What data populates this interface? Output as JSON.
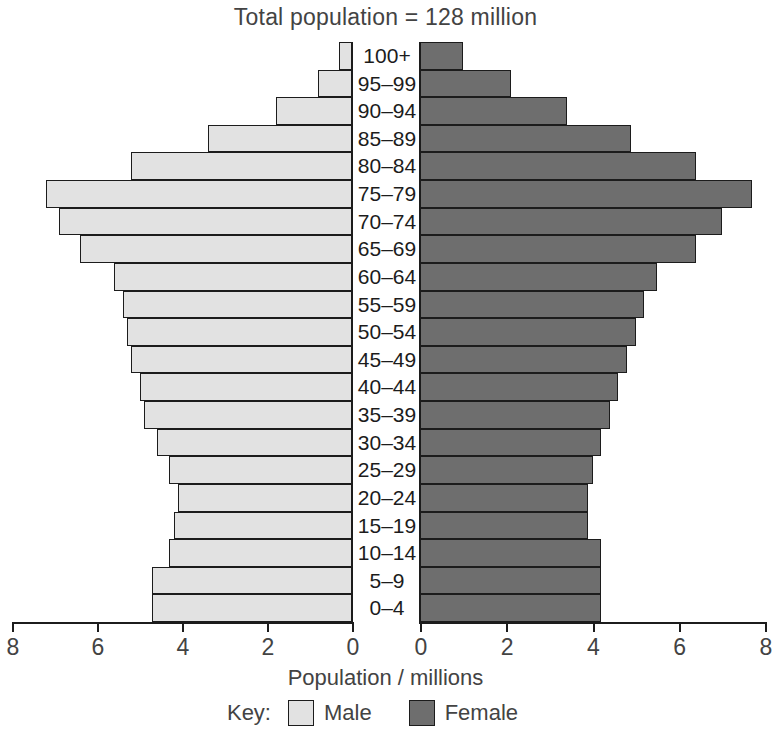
{
  "chart": {
    "title": "Total population = 128 million",
    "axis_caption": "Population / millions",
    "legend": {
      "key_label": "Key:",
      "entries": [
        {
          "label": "Male",
          "color": "#e2e2e2"
        },
        {
          "label": "Female",
          "color": "#6e6e6e"
        }
      ]
    },
    "tick_labels_male": [
      "8",
      "6",
      "4",
      "2",
      "0"
    ],
    "tick_labels_female": [
      "0",
      "2",
      "4",
      "6",
      "8"
    ]
  },
  "chart_data": {
    "type": "bar",
    "subtype": "population-pyramid",
    "title": "Total population = 128 million",
    "xlabel": "Population / millions",
    "ylabel": "Age group / years",
    "total_population_millions": 128,
    "xlim": [
      0,
      8
    ],
    "xticks": [
      0,
      2,
      4,
      6,
      8
    ],
    "grid": false,
    "legend_position": "bottom",
    "categories": [
      "100+",
      "95–99",
      "90–94",
      "85–89",
      "80–84",
      "75–79",
      "70–74",
      "65–69",
      "60–64",
      "55–59",
      "50–54",
      "45–49",
      "40–44",
      "35–39",
      "30–34",
      "25–29",
      "20–24",
      "15–19",
      "10–14",
      "5–9",
      "0–4"
    ],
    "series": [
      {
        "name": "Male",
        "color": "#e2e2e2",
        "side": "left",
        "values": [
          0.3,
          0.8,
          1.8,
          3.4,
          5.2,
          7.2,
          6.9,
          6.4,
          5.6,
          5.4,
          5.3,
          5.2,
          5.0,
          4.9,
          4.6,
          4.3,
          4.1,
          4.2,
          4.3,
          4.7,
          4.7
        ]
      },
      {
        "name": "Female",
        "color": "#6e6e6e",
        "side": "right",
        "values": [
          1.0,
          2.1,
          3.4,
          4.9,
          6.4,
          7.7,
          7.0,
          6.4,
          5.5,
          5.2,
          5.0,
          4.8,
          4.6,
          4.4,
          4.2,
          4.0,
          3.9,
          3.9,
          4.2,
          4.2,
          4.2
        ]
      }
    ]
  }
}
